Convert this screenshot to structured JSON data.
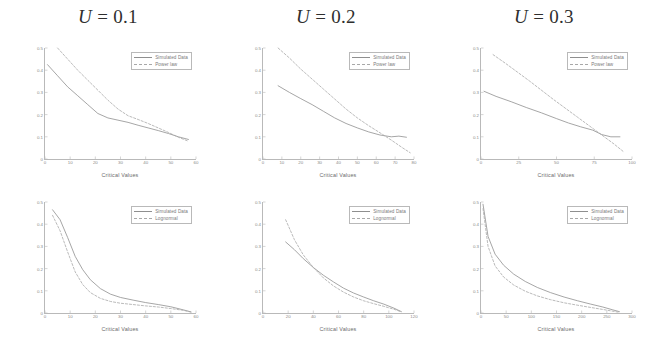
{
  "figure": {
    "background": "#ffffff",
    "columns": [
      {
        "id": "col-u01",
        "title_var": "U",
        "title_eq": " = 0.1"
      },
      {
        "id": "col-u02",
        "title_var": "U",
        "title_eq": " = 0.2"
      },
      {
        "id": "col-u03",
        "title_var": "U",
        "title_eq": " = 0.3"
      }
    ],
    "axis": {
      "xlabel": "Critical Values",
      "ylabel": "P( α >= Critical Value)"
    },
    "legend": {
      "simulated": "Simulated Data",
      "powerlaw": "Power law",
      "lognormal": "Lognormal"
    },
    "colors": {
      "simulated": "#8f8f8f",
      "model": "#a8a8a8",
      "axis": "#b9b9b9",
      "text": "#6a6a6a",
      "title": "#2e2e2e"
    }
  },
  "chart_data": [
    {
      "id": "panel-powerlaw-u01",
      "type": "line",
      "title": "U = 0.1",
      "xlabel": "Critical Values",
      "ylabel": "P( α >= Critical Value)",
      "xlim": [
        0,
        60
      ],
      "ylim": [
        0,
        0.5
      ],
      "xticks": [
        0,
        10,
        20,
        30,
        40,
        50,
        60
      ],
      "yticks": [
        0,
        0.1,
        0.2,
        0.3,
        0.4,
        0.5
      ],
      "grid": false,
      "legend_position": "upper right",
      "series": [
        {
          "name": "Simulated Data",
          "x": [
            1,
            5,
            9,
            13,
            17,
            21,
            25,
            29,
            33,
            37,
            41,
            45,
            49,
            53,
            57
          ],
          "y": [
            0.425,
            0.375,
            0.325,
            0.285,
            0.245,
            0.205,
            0.185,
            0.175,
            0.165,
            0.152,
            0.14,
            0.128,
            0.115,
            0.1,
            0.088
          ]
        },
        {
          "name": "Power law",
          "x": [
            5,
            9,
            13,
            17,
            21,
            25,
            29,
            33,
            37,
            41,
            45,
            49,
            53,
            57
          ],
          "y": [
            0.5,
            0.45,
            0.4,
            0.355,
            0.31,
            0.265,
            0.225,
            0.195,
            0.178,
            0.16,
            0.14,
            0.12,
            0.098,
            0.08
          ]
        }
      ]
    },
    {
      "id": "panel-powerlaw-u02",
      "type": "line",
      "title": "U = 0.2",
      "xlabel": "Critical Values",
      "ylabel": "P( α >= Critical Value)",
      "xlim": [
        0,
        80
      ],
      "ylim": [
        0,
        0.5
      ],
      "xticks": [
        0,
        10,
        20,
        30,
        40,
        50,
        60,
        70,
        80
      ],
      "yticks": [
        0,
        0.1,
        0.2,
        0.3,
        0.4,
        0.5
      ],
      "grid": false,
      "legend_position": "upper right",
      "series": [
        {
          "name": "Simulated Data",
          "x": [
            8,
            14,
            20,
            26,
            32,
            38,
            44,
            50,
            56,
            62,
            68,
            72,
            76
          ],
          "y": [
            0.33,
            0.3,
            0.272,
            0.245,
            0.215,
            0.185,
            0.16,
            0.14,
            0.122,
            0.108,
            0.1,
            0.103,
            0.098
          ]
        },
        {
          "name": "Power law",
          "x": [
            8,
            14,
            20,
            26,
            32,
            38,
            44,
            50,
            56,
            62,
            68,
            74,
            78
          ],
          "y": [
            0.5,
            0.455,
            0.405,
            0.36,
            0.315,
            0.27,
            0.225,
            0.185,
            0.15,
            0.118,
            0.085,
            0.05,
            0.028
          ]
        }
      ]
    },
    {
      "id": "panel-powerlaw-u03",
      "type": "line",
      "title": "U = 0.3",
      "xlabel": "Critical Values",
      "ylabel": "P( α >= Critical Value)",
      "xlim": [
        0,
        100
      ],
      "ylim": [
        0,
        0.5
      ],
      "xticks": [
        0,
        25,
        50,
        75,
        100
      ],
      "yticks": [
        0,
        0.1,
        0.2,
        0.3,
        0.4,
        0.5
      ],
      "grid": false,
      "legend_position": "upper right",
      "series": [
        {
          "name": "Simulated Data",
          "x": [
            2,
            10,
            20,
            30,
            40,
            50,
            58,
            66,
            74,
            80,
            86,
            92
          ],
          "y": [
            0.305,
            0.282,
            0.258,
            0.232,
            0.208,
            0.182,
            0.162,
            0.145,
            0.13,
            0.11,
            0.1,
            0.1
          ]
        },
        {
          "name": "Power law",
          "x": [
            8,
            16,
            24,
            32,
            40,
            48,
            56,
            64,
            72,
            80,
            88,
            94
          ],
          "y": [
            0.47,
            0.432,
            0.392,
            0.352,
            0.31,
            0.268,
            0.228,
            0.188,
            0.148,
            0.108,
            0.068,
            0.035
          ]
        }
      ]
    },
    {
      "id": "panel-lognormal-u01",
      "type": "line",
      "title": "U = 0.1",
      "xlabel": "Critical Values",
      "ylabel": "P( α >= Critical Value)",
      "xlim": [
        0,
        60
      ],
      "ylim": [
        0,
        0.5
      ],
      "xticks": [
        0,
        10,
        20,
        30,
        40,
        50,
        60
      ],
      "yticks": [
        0,
        0.1,
        0.2,
        0.3,
        0.4,
        0.5
      ],
      "grid": false,
      "legend_position": "upper right",
      "series": [
        {
          "name": "Simulated Data",
          "x": [
            3,
            6,
            9,
            12,
            15,
            18,
            22,
            26,
            30,
            35,
            40,
            45,
            50,
            55,
            58
          ],
          "y": [
            0.465,
            0.42,
            0.34,
            0.255,
            0.195,
            0.15,
            0.11,
            0.085,
            0.07,
            0.058,
            0.047,
            0.038,
            0.028,
            0.014,
            0.005
          ]
        },
        {
          "name": "Lognormal",
          "x": [
            3,
            6,
            9,
            12,
            15,
            18,
            22,
            26,
            30,
            35,
            40,
            45,
            50,
            55,
            58
          ],
          "y": [
            0.44,
            0.37,
            0.275,
            0.185,
            0.128,
            0.092,
            0.066,
            0.052,
            0.044,
            0.038,
            0.032,
            0.027,
            0.02,
            0.012,
            0.004
          ]
        }
      ]
    },
    {
      "id": "panel-lognormal-u02",
      "type": "line",
      "title": "U = 0.2",
      "xlabel": "Critical Values",
      "ylabel": "P( α >= Critical Value)",
      "xlim": [
        0,
        120
      ],
      "ylim": [
        0,
        0.5
      ],
      "xticks": [
        0,
        20,
        40,
        60,
        80,
        100,
        120
      ],
      "yticks": [
        0,
        0.1,
        0.2,
        0.3,
        0.4,
        0.5
      ],
      "grid": false,
      "legend_position": "upper right",
      "series": [
        {
          "name": "Simulated Data",
          "x": [
            18,
            25,
            32,
            40,
            48,
            56,
            64,
            72,
            80,
            88,
            96,
            104,
            110
          ],
          "y": [
            0.32,
            0.285,
            0.245,
            0.205,
            0.17,
            0.14,
            0.112,
            0.09,
            0.072,
            0.055,
            0.04,
            0.022,
            0.006
          ]
        },
        {
          "name": "Lognormal",
          "x": [
            18,
            25,
            32,
            40,
            48,
            56,
            64,
            72,
            80,
            88,
            96,
            104,
            110
          ],
          "y": [
            0.42,
            0.33,
            0.262,
            0.205,
            0.158,
            0.122,
            0.094,
            0.072,
            0.055,
            0.042,
            0.03,
            0.017,
            0.005
          ]
        }
      ]
    },
    {
      "id": "panel-lognormal-u03",
      "type": "line",
      "title": "U = 0.3",
      "xlabel": "Critical Values",
      "ylabel": "P( α >= Critical Value)",
      "xlim": [
        0,
        300
      ],
      "ylim": [
        0,
        0.5
      ],
      "xticks": [
        0,
        50,
        100,
        150,
        200,
        250,
        300
      ],
      "yticks": [
        0,
        0.1,
        0.2,
        0.3,
        0.4,
        0.5
      ],
      "grid": false,
      "legend_position": "upper right",
      "series": [
        {
          "name": "Simulated Data",
          "x": [
            4,
            14,
            28,
            45,
            65,
            88,
            112,
            138,
            165,
            192,
            218,
            242,
            262,
            275
          ],
          "y": [
            0.49,
            0.345,
            0.265,
            0.215,
            0.175,
            0.142,
            0.115,
            0.092,
            0.072,
            0.055,
            0.04,
            0.027,
            0.014,
            0.006
          ]
        },
        {
          "name": "Lognormal",
          "x": [
            4,
            14,
            28,
            45,
            65,
            88,
            112,
            138,
            165,
            192,
            218,
            242,
            262,
            275
          ],
          "y": [
            0.47,
            0.3,
            0.212,
            0.162,
            0.126,
            0.098,
            0.077,
            0.06,
            0.046,
            0.035,
            0.025,
            0.016,
            0.008,
            0.003
          ]
        }
      ]
    }
  ]
}
